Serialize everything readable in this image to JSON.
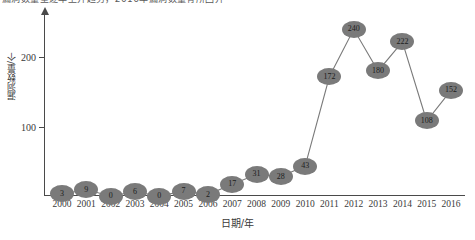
{
  "top_clipped_text": "漏洞数量呈逐年上升趋势，2016年漏洞数量有所回升",
  "chart_data": {
    "type": "line",
    "title": "",
    "xlabel": "日期/年",
    "ylabel": "漏洞数量/个",
    "categories": [
      "2000",
      "2001",
      "2002",
      "2003",
      "2004",
      "2005",
      "2006",
      "2007",
      "2008",
      "2009",
      "2010",
      "2011",
      "2012",
      "2013",
      "2014",
      "2015",
      "2016"
    ],
    "values": [
      3,
      9,
      0,
      6,
      0,
      7,
      2,
      17,
      31,
      28,
      43,
      172,
      240,
      180,
      222,
      108,
      152
    ],
    "ylim": [
      0,
      262
    ],
    "yticks": [
      100,
      200
    ],
    "ytick_labels": [
      "100",
      "200"
    ],
    "grid": false,
    "legend": false,
    "marker_labels_shown": true,
    "colors": {
      "line": "#7a7a7a",
      "marker_fill": "#7a7a7a",
      "marker_text": "#1c1c1c",
      "axis": "#4a4a4a",
      "tick_text": "#3a3a3a",
      "background": "#ffffff"
    }
  }
}
